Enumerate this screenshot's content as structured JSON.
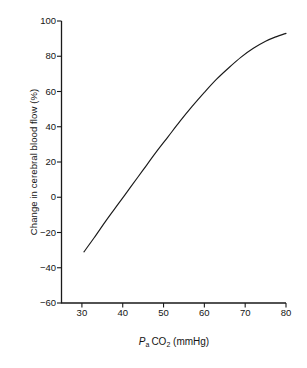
{
  "figure": {
    "background_color": "#ffffff",
    "line_color": "#1a1a1a",
    "axis_color": "#1a1a1a"
  },
  "axis_titles": {
    "y": "Change in cerebral blood flow (%)",
    "x_prefix": "P",
    "x_sub_a": "a",
    "x_co": "CO",
    "x_sub_2": "2",
    "x_units": "(mmHg)",
    "x_full": "Pa CO2 (mmHg)"
  },
  "y_ticks": [
    {
      "value": 100,
      "label": "100"
    },
    {
      "value": 80,
      "label": "80"
    },
    {
      "value": 60,
      "label": "60"
    },
    {
      "value": 40,
      "label": "40"
    },
    {
      "value": 20,
      "label": "20"
    },
    {
      "value": 0,
      "label": "0"
    },
    {
      "value": -20,
      "label": "−20"
    },
    {
      "value": -40,
      "label": "−40"
    },
    {
      "value": -60,
      "label": "−60"
    }
  ],
  "x_ticks": [
    {
      "value": 30,
      "label": "30"
    },
    {
      "value": 40,
      "label": "40"
    },
    {
      "value": 50,
      "label": "50"
    },
    {
      "value": 60,
      "label": "60"
    },
    {
      "value": 70,
      "label": "70"
    },
    {
      "value": 80,
      "label": "80"
    }
  ],
  "chart_data": {
    "type": "line",
    "title": "",
    "subtitle": "",
    "xlabel": "Pa CO2 (mmHg)",
    "ylabel": "Change in cerebral blood flow (%)",
    "xlim": [
      25,
      80
    ],
    "ylim": [
      -60,
      100
    ],
    "xticks": [
      30,
      40,
      50,
      60,
      70,
      80
    ],
    "yticks": [
      -60,
      -40,
      -20,
      0,
      20,
      40,
      60,
      80,
      100
    ],
    "grid": false,
    "legend": null,
    "legend_position": "none",
    "annotations": [],
    "series": [
      {
        "name": "Change in cerebral blood flow",
        "x": [
          30.5,
          33,
          36,
          39,
          42,
          45,
          48,
          51,
          54,
          57,
          60,
          63,
          66,
          69,
          72,
          75,
          77.5,
          80
        ],
        "y": [
          -31,
          -23,
          -13,
          -3.5,
          6,
          15.5,
          25,
          34,
          43,
          51.5,
          59.5,
          67,
          73.5,
          79.5,
          84.5,
          88.5,
          91,
          93
        ]
      }
    ]
  }
}
